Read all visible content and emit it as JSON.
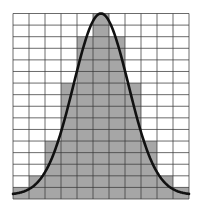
{
  "chart_data": {
    "type": "bar",
    "title": "",
    "xlabel": "",
    "ylabel": "",
    "categories": [
      "1",
      "2",
      "3",
      "4",
      "5",
      "6",
      "7",
      "8",
      "9",
      "10",
      "11"
    ],
    "values": [
      1,
      2,
      5,
      10,
      14,
      16,
      14,
      10,
      5,
      2,
      1
    ],
    "ylim": [
      0,
      16
    ],
    "grid": true,
    "legend": null,
    "overlay": {
      "type": "line",
      "name": "normal-curve",
      "description": "Normal distribution curve fitted over histogram",
      "mean_bin": 5,
      "peak_value": 16
    },
    "layout": {
      "grid_columns": 11,
      "grid_rows": 16
    }
  },
  "colors": {
    "bar_fill": "#a6a6a6",
    "grid_line": "#3a3a3a",
    "curve": "#111111",
    "background": "#ffffff"
  }
}
